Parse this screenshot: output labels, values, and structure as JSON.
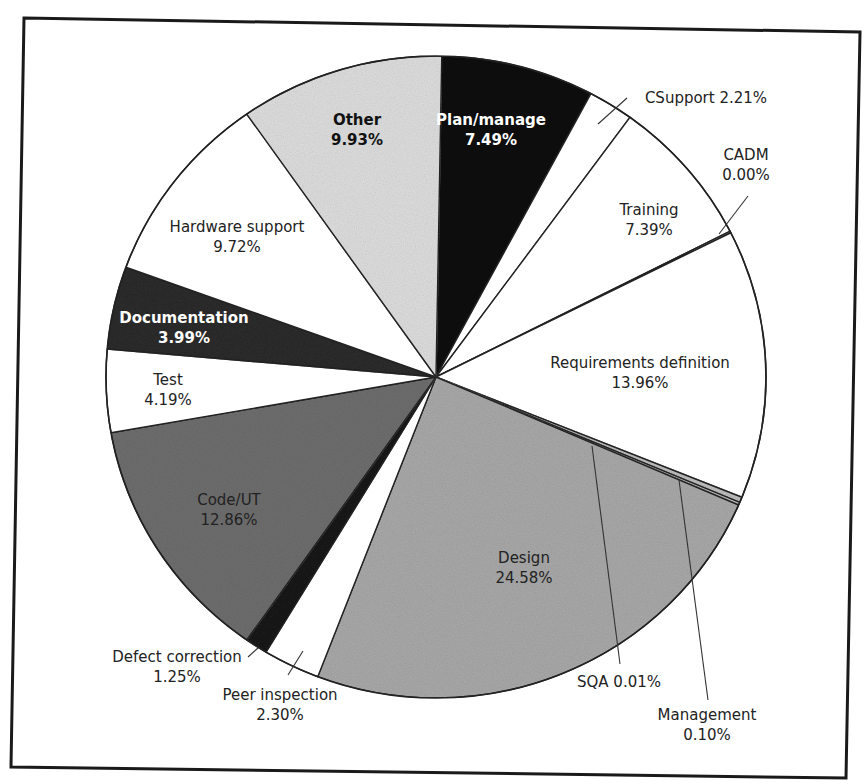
{
  "chart_data": {
    "type": "pie",
    "title": "",
    "legend": "none (labels placed on/near slices)",
    "slices": [
      {
        "label": "Plan/manage",
        "value": 7.49,
        "display": "7.49%",
        "fill": "#111111",
        "label_color": "#ffffff",
        "bold": true,
        "start_deg": 1,
        "end_deg": 28
      },
      {
        "label": "CSupport",
        "value": 2.21,
        "display": "2.21%",
        "fill": "#ffffff",
        "label_color": "#222222",
        "bold": false,
        "start_deg": 28,
        "end_deg": 36
      },
      {
        "label": "Training",
        "value": 7.39,
        "display": "7.39%",
        "fill": "#ffffff",
        "label_color": "#222222",
        "bold": false,
        "start_deg": 36,
        "end_deg": 63
      },
      {
        "label": "CADM",
        "value": 0.0,
        "display": "0.00%",
        "fill": "#ffffff",
        "label_color": "#222222",
        "bold": false,
        "start_deg": 63,
        "end_deg": 63.3
      },
      {
        "label": "Requirements definition",
        "value": 13.96,
        "display": "13.96%",
        "fill": "#ffffff",
        "label_color": "#222222",
        "bold": false,
        "start_deg": 63.3,
        "end_deg": 112
      },
      {
        "label": "Management",
        "value": 0.1,
        "display": "0.10%",
        "fill": "#bdbdbd",
        "label_color": "#222222",
        "bold": false,
        "start_deg": 112,
        "end_deg": 113
      },
      {
        "label": "SQA",
        "value": 0.01,
        "display": "0.01%",
        "fill": "#bdbdbd",
        "label_color": "#222222",
        "bold": false,
        "start_deg": 113,
        "end_deg": 113.5
      },
      {
        "label": "Design",
        "value": 24.58,
        "display": "24.58%",
        "fill": "#a9a9a9",
        "label_color": "#222222",
        "bold": false,
        "start_deg": 113.5,
        "end_deg": 201
      },
      {
        "label": "Peer inspection",
        "value": 2.3,
        "display": "2.30%",
        "fill": "#ffffff",
        "label_color": "#222222",
        "bold": false,
        "start_deg": 201,
        "end_deg": 211
      },
      {
        "label": "Defect correction",
        "value": 1.25,
        "display": "1.25%",
        "fill": "#1a1a1a",
        "label_color": "#222222",
        "bold": false,
        "start_deg": 211,
        "end_deg": 215
      },
      {
        "label": "Code/UT",
        "value": 12.86,
        "display": "12.86%",
        "fill": "#6e6e6e",
        "label_color": "#dddddd",
        "bold": false,
        "start_deg": 215,
        "end_deg": 260
      },
      {
        "label": "Test",
        "value": 4.19,
        "display": "4.19%",
        "fill": "#ffffff",
        "label_color": "#222222",
        "bold": false,
        "start_deg": 260,
        "end_deg": 275
      },
      {
        "label": "Documentation",
        "value": 3.99,
        "display": "3.99%",
        "fill": "#2b2b2b",
        "label_color": "#ffffff",
        "bold": true,
        "start_deg": 275,
        "end_deg": 290
      },
      {
        "label": "Hardware support",
        "value": 9.72,
        "display": "9.72%",
        "fill": "#ffffff",
        "label_color": "#222222",
        "bold": false,
        "start_deg": 290,
        "end_deg": 325
      },
      {
        "label": "Other",
        "value": 9.93,
        "display": "9.93%",
        "fill": "#dedede",
        "label_color": "#111111",
        "bold": true,
        "start_deg": 325,
        "end_deg": 361
      }
    ],
    "labels": [
      {
        "id": "plan",
        "line1": "Plan/manage",
        "line2": "7.49%",
        "x": 491,
        "y": 125,
        "color": "#ffffff",
        "bold": true
      },
      {
        "id": "csupport",
        "line1": "CSupport 2.21%",
        "line2": "",
        "x": 706,
        "y": 103,
        "color": "#222222",
        "bold": false
      },
      {
        "id": "cadm",
        "line1": "CADM",
        "line2": "0.00%",
        "x": 746,
        "y": 160,
        "color": "#222222",
        "bold": false
      },
      {
        "id": "training",
        "line1": "Training",
        "line2": "7.39%",
        "x": 649,
        "y": 215,
        "color": "#222222",
        "bold": false
      },
      {
        "id": "req",
        "line1": "Requirements definition",
        "line2": "13.96%",
        "x": 640,
        "y": 368,
        "color": "#222222",
        "bold": false
      },
      {
        "id": "design",
        "line1": "Design",
        "line2": "24.58%",
        "x": 524,
        "y": 563,
        "color": "#222222",
        "bold": false
      },
      {
        "id": "sqa",
        "line1": "SQA 0.01%",
        "line2": "",
        "x": 619,
        "y": 687,
        "color": "#222222",
        "bold": false
      },
      {
        "id": "management",
        "line1": "Management",
        "line2": "0.10%",
        "x": 707,
        "y": 720,
        "color": "#222222",
        "bold": false
      },
      {
        "id": "peer",
        "line1": "Peer inspection",
        "line2": "2.30%",
        "x": 280,
        "y": 700,
        "color": "#222222",
        "bold": false
      },
      {
        "id": "defect",
        "line1": "Defect correction",
        "line2": "1.25%",
        "x": 177,
        "y": 662,
        "color": "#222222",
        "bold": false
      },
      {
        "id": "code",
        "line1": "Code/UT",
        "line2": "12.86%",
        "x": 229,
        "y": 505,
        "color": "#e0e0e0",
        "bold": false
      },
      {
        "id": "test",
        "line1": "Test",
        "line2": "4.19%",
        "x": 168,
        "y": 385,
        "color": "#222222",
        "bold": false
      },
      {
        "id": "doc",
        "line1": "Documentation",
        "line2": "3.99%",
        "x": 184,
        "y": 323,
        "color": "#ffffff",
        "bold": true
      },
      {
        "id": "hardware",
        "line1": "Hardware support",
        "line2": "9.72%",
        "x": 237,
        "y": 232,
        "color": "#222222",
        "bold": false
      },
      {
        "id": "other",
        "line1": "Other",
        "line2": "9.93%",
        "x": 357,
        "y": 125,
        "color": "#111111",
        "bold": true
      }
    ],
    "leaders": [
      {
        "for": "csupport",
        "x1": 598,
        "y1": 124,
        "x2": 627,
        "y2": 98
      },
      {
        "for": "cadm",
        "x1": 719,
        "y1": 234,
        "x2": 748,
        "y2": 196
      },
      {
        "for": "sqa",
        "x1": 592,
        "y1": 446,
        "x2": 620,
        "y2": 664
      },
      {
        "for": "management",
        "x1": 679,
        "y1": 480,
        "x2": 708,
        "y2": 700
      },
      {
        "for": "peer",
        "x1": 288,
        "y1": 675,
        "x2": 303,
        "y2": 651
      },
      {
        "for": "defect",
        "x1": 248,
        "y1": 657,
        "x2": 258,
        "y2": 648
      }
    ],
    "geometry": {
      "cx": 436,
      "cy": 377,
      "rx": 330,
      "ry": 321
    }
  }
}
